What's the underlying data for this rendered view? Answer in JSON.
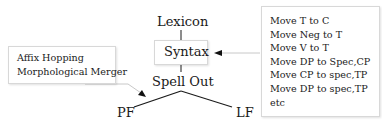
{
  "diagram": {
    "nodes": {
      "lexicon": "Lexicon",
      "syntax": "Syntax",
      "spell_out": "Spell Out",
      "pf": "PF",
      "lf": "LF"
    },
    "pf_operations_box": {
      "lines": [
        "Affix Hopping",
        "Morphological Merger"
      ]
    },
    "syntax_operations_box": {
      "lines": [
        "Move T to C",
        "Move Neg to T",
        "Move V to T",
        "Move DP to Spec,CP",
        "Move CP to spec,TP",
        "Move DP to spec,TP",
        "etc"
      ]
    },
    "colors": {
      "line": "#1a1a1a",
      "arrow_line": "#c8c8c8",
      "box_border": "#d8d8d8"
    }
  }
}
